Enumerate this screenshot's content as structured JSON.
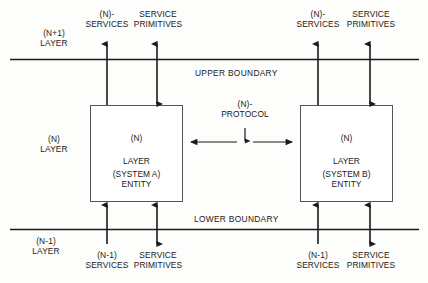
{
  "diagram": {
    "colors": {
      "line": "#1a1a1a",
      "text": "#1a1a1a",
      "background": "#fdfdfb",
      "box_fill": "#ffffff",
      "box_border": "#555555"
    },
    "layers": {
      "upper_layer_label": "(N+1)\nLAYER",
      "middle_layer_label": "(N)\nLAYER",
      "lower_layer_label": "(N-1)\nLAYER"
    },
    "boundaries": {
      "upper": "UPPER BOUNDARY",
      "lower": "LOWER BOUNDARY"
    },
    "entities": [
      {
        "id": "system-a",
        "line1": "(N)",
        "line2": "LAYER",
        "line3": "ENTITY",
        "system": "(SYSTEM A)"
      },
      {
        "id": "system-b",
        "line1": "(N)",
        "line2": "LAYER",
        "line3": "ENTITY",
        "system": "(SYSTEM B)"
      }
    ],
    "protocol": {
      "label": "(N)-\nPROTOCOL"
    },
    "top_annotations": [
      {
        "id": "left-n-services",
        "text": "(N)-\nSERVICES",
        "arrow": "up"
      },
      {
        "id": "left-primitives",
        "text": "SERVICE\nPRIMITIVES",
        "arrow": "both"
      },
      {
        "id": "right-n-services",
        "text": "(N)-\nSERVICES",
        "arrow": "up"
      },
      {
        "id": "right-primitives",
        "text": "SERVICE\nPRIMITIVES",
        "arrow": "both"
      }
    ],
    "bottom_annotations": [
      {
        "id": "left-n1-services",
        "text": "(N-1)\nSERVICES",
        "arrow": "up"
      },
      {
        "id": "left-primitives-b",
        "text": "SERVICE\nPRIMITIVES",
        "arrow": "both"
      },
      {
        "id": "right-n1-services",
        "text": "(N-1)\nSERVICES",
        "arrow": "up"
      },
      {
        "id": "right-primitives-b",
        "text": "SERVICE\nPRIMITIVES",
        "arrow": "both"
      }
    ]
  }
}
